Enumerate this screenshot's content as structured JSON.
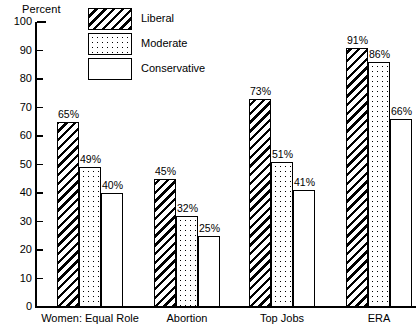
{
  "chart_data": {
    "type": "bar",
    "title": "",
    "ylabel": "Percent",
    "xlabel": "",
    "ylim": [
      0,
      100
    ],
    "ytick_step": 10,
    "grid": false,
    "legend_position": "top-center",
    "categories": [
      "Women: Equal Role",
      "Abortion",
      "Top Jobs",
      "ERA"
    ],
    "ytick_labels": [
      "100",
      "90",
      "80",
      "70",
      "60",
      "50",
      "40",
      "30",
      "20",
      "10",
      "0"
    ],
    "series": [
      {
        "name": "Liberal",
        "pattern": "diagonal-hatch",
        "values": [
          65,
          45,
          73,
          91
        ],
        "labels": [
          "65%",
          "45%",
          "73%",
          "91%"
        ]
      },
      {
        "name": "Moderate",
        "pattern": "dotted",
        "values": [
          49,
          32,
          51,
          86
        ],
        "labels": [
          "49%",
          "32%",
          "51%",
          "86%"
        ]
      },
      {
        "name": "Conservative",
        "pattern": "solid-white",
        "values": [
          40,
          25,
          41,
          66
        ],
        "labels": [
          "40%",
          "25%",
          "41%",
          "66%"
        ]
      }
    ]
  },
  "colors": {
    "ink": "#000000",
    "background": "#ffffff"
  }
}
